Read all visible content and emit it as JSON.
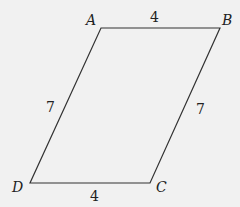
{
  "figure": {
    "type": "parallelogram",
    "background": "#f1f1f1",
    "stroke": "#333333",
    "vertices": {
      "A": {
        "label": "A"
      },
      "B": {
        "label": "B"
      },
      "C": {
        "label": "C"
      },
      "D": {
        "label": "D"
      }
    },
    "sides": {
      "AB": {
        "length": "4"
      },
      "BC": {
        "length": "7"
      },
      "CD": {
        "length": "4"
      },
      "DA": {
        "length": "7"
      }
    }
  }
}
